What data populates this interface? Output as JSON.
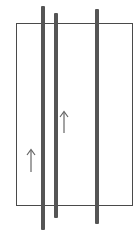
{
  "diagram": {
    "colors": {
      "background": "#ffffff",
      "frame": "#4a4a4a",
      "rod": "#555555",
      "arrow": "#666666"
    },
    "frame": {
      "left": 16,
      "top": 23,
      "width": 117,
      "height": 183
    },
    "rods": [
      {
        "id": "rod-1",
        "left": 41,
        "top": 6,
        "width": 4,
        "height": 224
      },
      {
        "id": "rod-2",
        "left": 54,
        "top": 13,
        "width": 4,
        "height": 205
      },
      {
        "id": "rod-3",
        "left": 95,
        "top": 9,
        "width": 4,
        "height": 215
      }
    ],
    "arrows": [
      {
        "id": "arrow-1",
        "x": 31,
        "y_tail": 172,
        "y_head": 149,
        "direction": "up"
      },
      {
        "id": "arrow-2",
        "x": 64,
        "y_tail": 133,
        "y_head": 111,
        "direction": "up"
      }
    ]
  }
}
